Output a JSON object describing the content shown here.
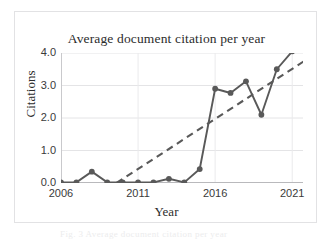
{
  "figure": {
    "caption_ghost": "Fig. 3  Average document citation per year"
  },
  "chart_data": {
    "type": "line",
    "title": "Average document citation per year",
    "xlabel": "Year",
    "ylabel": "Citations",
    "xlim": [
      2006,
      2021.7
    ],
    "ylim": [
      0.0,
      4.0
    ],
    "grid": true,
    "legend": "none",
    "marker": "filled-circle",
    "series_color": "#595959",
    "trend_color": "#595959",
    "x": [
      2006,
      2007,
      2008,
      2009,
      2010,
      2011,
      2012,
      2013,
      2014,
      2015,
      2016,
      2017,
      2018,
      2019,
      2020,
      2021
    ],
    "values": [
      0.02,
      0.02,
      0.35,
      0.02,
      0.02,
      0.02,
      0.02,
      0.13,
      0.02,
      0.43,
      2.9,
      2.77,
      3.13,
      2.1,
      3.5,
      4.05
    ],
    "series": [
      {
        "name": "Average document citation per year",
        "style": "solid-line-with-markers",
        "values": [
          0.02,
          0.02,
          0.35,
          0.02,
          0.02,
          0.02,
          0.02,
          0.13,
          0.02,
          0.43,
          2.9,
          2.77,
          3.13,
          2.1,
          3.5,
          4.05
        ]
      },
      {
        "name": "Linear trendline",
        "style": "dashed-line",
        "x": [
          2009.6,
          2022.0
        ],
        "values": [
          0.0,
          3.82
        ]
      }
    ],
    "yticks": [
      0.0,
      1.0,
      2.0,
      3.0,
      4.0
    ],
    "ytick_labels": [
      "0.0",
      "1.0",
      "2.0",
      "3.0",
      "4.0"
    ],
    "xticks": [
      2006,
      2011,
      2016,
      2021
    ],
    "xtick_labels": [
      "2006",
      "2011",
      "2016",
      "2021"
    ],
    "annotations": []
  }
}
